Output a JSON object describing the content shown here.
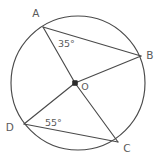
{
  "figure": {
    "background_color": "#ffffff",
    "stroke_color": "#4a4a4a",
    "label_color": "#5a5a5a",
    "center_dot_color": "#2b2b2b"
  },
  "circle": {
    "cx": 78,
    "cy": 83,
    "r": 67
  },
  "points": {
    "A": {
      "label": "A",
      "x": 43,
      "y": 27,
      "label_x": 36,
      "label_y": 17
    },
    "B": {
      "label": "B",
      "x": 141,
      "y": 56,
      "label_x": 150,
      "label_y": 59
    },
    "C": {
      "label": "C",
      "x": 118,
      "y": 142,
      "label_x": 127,
      "label_y": 152
    },
    "D": {
      "label": "D",
      "x": 24,
      "y": 124,
      "label_x": 10,
      "label_y": 131
    },
    "O": {
      "label": "O",
      "x": 75,
      "y": 83,
      "label_x": 85,
      "label_y": 90
    }
  },
  "segments": [
    {
      "name": "segment-AB",
      "from": "A",
      "to": "B"
    },
    {
      "name": "segment-AO",
      "from": "A",
      "to": "O"
    },
    {
      "name": "segment-OB",
      "from": "O",
      "to": "B"
    },
    {
      "name": "segment-OD",
      "from": "O",
      "to": "D"
    },
    {
      "name": "segment-OC",
      "from": "O",
      "to": "C"
    },
    {
      "name": "segment-DC",
      "from": "D",
      "to": "C"
    }
  ],
  "angles": [
    {
      "name": "angle-at-A",
      "text": "35°",
      "value": 35,
      "unit": "degrees",
      "vertex": "A",
      "x": 58,
      "y": 47
    },
    {
      "name": "angle-at-D",
      "text": "55°",
      "value": 55,
      "unit": "degrees",
      "vertex": "D",
      "x": 45,
      "y": 126
    }
  ]
}
